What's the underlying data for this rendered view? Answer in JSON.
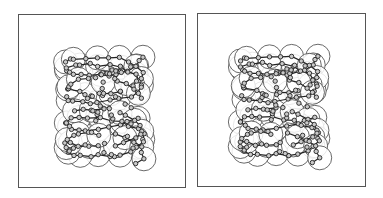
{
  "figure": {
    "type": "stereo-pair molecular structure",
    "panels": [
      {
        "id": "left",
        "label": "left-eye view",
        "x": 18,
        "y": 14,
        "w": 168,
        "h": 174,
        "offset_x": 0
      },
      {
        "id": "right",
        "label": "right-eye view",
        "x": 197,
        "y": 13,
        "w": 169,
        "h": 174,
        "offset_x": -4
      }
    ],
    "colors": {
      "frame": "#555555",
      "bond": "#222222",
      "atom_fill": "#c8c8c8",
      "sphere": "#444444",
      "background": "#ffffff"
    },
    "molecule": {
      "description": "double helical nucleic acid backbone with van der Waals surface circles",
      "center": [
        86,
        88
      ],
      "helix_turns": 2,
      "sphere_radius": 12,
      "atom_radius": 2.2,
      "strands": 2
    }
  }
}
